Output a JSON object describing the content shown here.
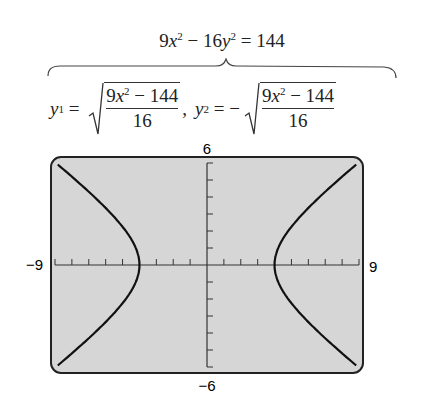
{
  "equation": {
    "lhs_a": "9",
    "lhs_var1": "x",
    "lhs_exp1": "2",
    "minus": " − 16",
    "lhs_var2": "y",
    "lhs_exp2": "2",
    "rhs": " = 144"
  },
  "solutions": {
    "y1_label": "y",
    "y1_sub": "1",
    "y1_eq": " = ",
    "y1_num_a": "9",
    "y1_num_var": "x",
    "y1_num_exp": "2",
    "y1_num_rest": " − 144",
    "y1_den": "16",
    "comma": ",",
    "y2_label": "y",
    "y2_sub": "2",
    "y2_eq": " = −",
    "y2_num_a": "9",
    "y2_num_var": "x",
    "y2_num_exp": "2",
    "y2_num_rest": " − 144",
    "y2_den": "16"
  },
  "window": {
    "ymax_label": "6",
    "ymin_label": "−6",
    "xmin_label": "−9",
    "xmax_label": "9",
    "screen_color": "#d6d6d6",
    "curve_color": "#1a1a1a"
  },
  "chart_data": {
    "type": "line",
    "xlim": [
      -9,
      9
    ],
    "ylim": [
      -6,
      6
    ],
    "xtick_step": 1,
    "ytick_step": 1,
    "series": [
      {
        "name": "y1 = sqrt((9x^2 − 144)/16)",
        "x": [
          -9,
          -8,
          -7,
          -6,
          -5,
          -4,
          4,
          5,
          6,
          7,
          8,
          9
        ],
        "values": [
          6.05,
          5.2,
          4.31,
          3.35,
          2.25,
          0,
          0,
          2.25,
          3.35,
          4.31,
          5.2,
          6.05
        ]
      },
      {
        "name": "y2 = −sqrt((9x^2 − 144)/16)",
        "x": [
          -9,
          -8,
          -7,
          -6,
          -5,
          -4,
          4,
          5,
          6,
          7,
          8,
          9
        ],
        "values": [
          -6.05,
          -5.2,
          -4.31,
          -3.35,
          -2.25,
          0,
          0,
          -2.25,
          -3.35,
          -4.31,
          -5.2,
          -6.05
        ]
      }
    ],
    "annotations": [
      "Xmin −9",
      "Xmax 9",
      "Ymin −6",
      "Ymax 6"
    ]
  }
}
